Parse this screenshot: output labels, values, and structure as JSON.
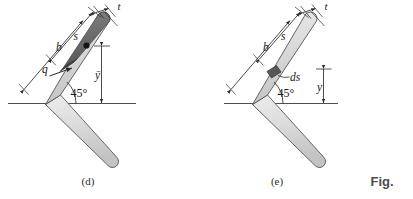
{
  "page": {
    "background": "#ffffff",
    "width": 413,
    "height": 199
  },
  "colors": {
    "bar_fill": "#d7d7d7",
    "bar_fill_light": "#e4e4e4",
    "bar_stroke": "#555555",
    "shaded_region": "#6e6e6e",
    "shaded_region_dark": "#4a4a4a",
    "element_square": "#5a5a5a",
    "dimension_line": "#2b2b2b",
    "baseline": "#3a3a3a",
    "text": "#1a1a1a",
    "fig_word": "#4d4d4d"
  },
  "figure_d": {
    "caption": "(d)",
    "angle_label": "45°",
    "labels": {
      "thickness": "t",
      "arc_length": "s",
      "leg_length": "b",
      "load": "q",
      "centroid_height": "ȳ"
    },
    "notes": {
      "shaded_description": "dark shaded upper portion of inclined arm",
      "dot_marker": "centroid point"
    }
  },
  "figure_e": {
    "caption": "(e)",
    "angle_label": "45°",
    "labels": {
      "thickness": "t",
      "arc_length": "s",
      "leg_length": "b",
      "differential_element": "ds",
      "height": "y"
    },
    "notes": {
      "element_description": "small dark differential element on inclined arm"
    }
  },
  "figure_word": {
    "text": "Fig."
  }
}
